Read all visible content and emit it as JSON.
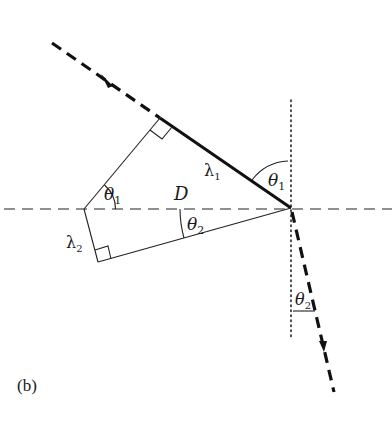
{
  "figure": {
    "panel_label": "(b)",
    "labels": {
      "theta1_top": "θ",
      "theta1_top_sub": "1",
      "theta1_left": "θ",
      "theta1_left_sub": "1",
      "theta2_mid": "θ",
      "theta2_mid_sub": "2",
      "theta2_bottom": "θ",
      "theta2_bottom_sub": "2",
      "lambda1": "λ",
      "lambda1_sub": "1",
      "lambda2": "λ",
      "lambda2_sub": "2",
      "distance": "D"
    },
    "elements": [
      "incident-ray (dashed, arrow)",
      "wavefront-segment lambda1 (solid thick)",
      "interface (horizontal dashed)",
      "normal (vertical dotted)",
      "refracted-ray (dashed, arrow)",
      "right-angle markers",
      "angle arcs"
    ],
    "colors": {
      "ink": "#1a1a1a",
      "background": "#ffffff"
    }
  }
}
